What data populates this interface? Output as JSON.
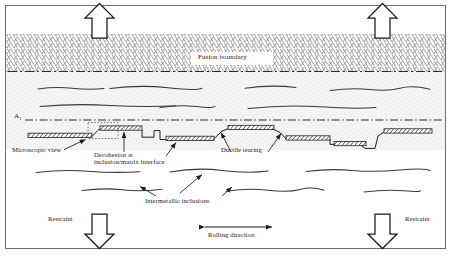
{
  "figure": {
    "type": "technical-schematic",
    "background_color": "#ffffff",
    "border_color": "#6e6e6e",
    "line_color": "#1a1a1a",
    "hatch_color": "#7a7a7a",
    "base_metal_fill": "#f4f3f1"
  },
  "labels": {
    "fusion_boundary": "Fusion boundary",
    "transformation_line": "A",
    "transformation_line_subscript": "1",
    "microscopic_view": "Microscopic view",
    "decohesion": "Decohesion at inclusion/matrix interface",
    "decohesion_line1": "Decohesion at",
    "decohesion_line2": "inclusion/matrix interface",
    "ductile_tearing": "Ductile tearing",
    "intermetallic_inclusions": "Intermetallic inclusions",
    "rolling_direction": "Rolling direction",
    "restraint_left": "Restraint",
    "restraint_right": "Restraint"
  },
  "arrows": {
    "top_left": {
      "direction": "up",
      "x": 98,
      "y": 5,
      "name": "tensile-load-arrow-top-left"
    },
    "top_right": {
      "direction": "up",
      "x": 382,
      "y": 5,
      "name": "tensile-load-arrow-top-right"
    },
    "bottom_left": {
      "direction": "down",
      "x": 98,
      "y": 215,
      "name": "restraint-arrow-bottom-left"
    },
    "bottom_right": {
      "direction": "down",
      "x": 382,
      "y": 215,
      "name": "restraint-arrow-bottom-right"
    },
    "rolling": {
      "direction": "double-horizontal",
      "name": "rolling-direction-arrow"
    }
  },
  "regions": {
    "weld_metal": {
      "name": "weld-metal-zone",
      "y_top": 34,
      "y_bottom": 72,
      "pattern": "chevron-hatch"
    },
    "heat_affected_zone": {
      "name": "heat-affected-zone",
      "y_top": 72,
      "y_bottom": 119,
      "pattern": "stipple"
    },
    "base_metal": {
      "name": "base-metal-zone",
      "y_top": 119,
      "y_bottom": 240,
      "pattern": "plain"
    }
  },
  "inclusion_bars": {
    "name": "intermetallic-inclusion-bars",
    "pattern": "diagonal-hatch",
    "count": 9
  }
}
